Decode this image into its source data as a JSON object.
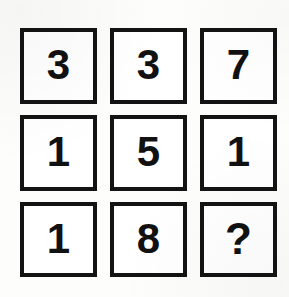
{
  "puzzle": {
    "type": "number-grid",
    "rows": 3,
    "columns": 3,
    "background_color": "#fdfdfc",
    "border_color": "#131313",
    "text_color": "#111111",
    "cell_background": "#ffffff",
    "cells": [
      {
        "row": 1,
        "column": 1,
        "value": "3",
        "unknown": false
      },
      {
        "row": 1,
        "column": 2,
        "value": "3",
        "unknown": false
      },
      {
        "row": 1,
        "column": 3,
        "value": "7",
        "unknown": false
      },
      {
        "row": 2,
        "column": 1,
        "value": "1",
        "unknown": false
      },
      {
        "row": 2,
        "column": 2,
        "value": "5",
        "unknown": false
      },
      {
        "row": 2,
        "column": 3,
        "value": "1",
        "unknown": false
      },
      {
        "row": 3,
        "column": 1,
        "value": "1",
        "unknown": false
      },
      {
        "row": 3,
        "column": 2,
        "value": "8",
        "unknown": false
      },
      {
        "row": 3,
        "column": 3,
        "value": "?",
        "unknown": true
      }
    ]
  }
}
